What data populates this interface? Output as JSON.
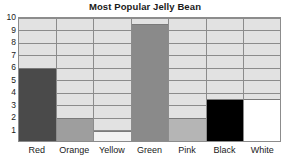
{
  "chart_data": {
    "type": "bar",
    "title": "Most Popular Jelly Bean",
    "xlabel": "",
    "ylabel": "",
    "categories": [
      "Red",
      "Orange",
      "Yellow",
      "Green",
      "Pink",
      "Black",
      "White"
    ],
    "values": [
      6,
      2,
      1,
      9.5,
      2,
      3.5,
      3.5
    ],
    "ylim": [
      0,
      10
    ],
    "y_ticks": [
      1,
      2,
      3,
      4,
      5,
      6,
      7,
      8,
      9,
      10
    ],
    "grid": true,
    "legend": false,
    "bar_colors": [
      "#4a4a4a",
      "#9e9e9e",
      "#f2f2f2",
      "#8a8a8a",
      "#b5b5b5",
      "#000000",
      "#ffffff"
    ],
    "plot_background": "#e2e2e2",
    "axis_color": "#8c8c8c",
    "text_color": "#1a1a1a"
  }
}
